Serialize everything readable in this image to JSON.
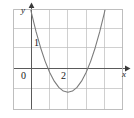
{
  "figure": {
    "name": "parabola-graph",
    "background_color": "#ffffff",
    "grid_color": "#b9b9b9",
    "axis_color": "#555555",
    "curve_color": "#6e6e6e",
    "border_color": "#b9b9b9"
  },
  "chart_data": {
    "type": "line",
    "title": "",
    "xlabel": "x",
    "ylabel": "y",
    "grid": true,
    "legend": false,
    "xlim": [
      -1,
      5
    ],
    "ylim": [
      -2.5,
      3
    ],
    "xticks": [
      0,
      2
    ],
    "yticks": [
      1
    ],
    "xtick_labels": [
      "0",
      "2"
    ],
    "ytick_labels": [
      "1"
    ],
    "x_minor_step": 1,
    "y_minor_step": 1,
    "annotations": [],
    "series": [
      {
        "name": "parabola",
        "equation": "y = (x - 2)^2 - 1.2",
        "vertex": [
          2,
          -1.2
        ],
        "roots": [
          0.3,
          3.7
        ],
        "x": [
          -1.0,
          -0.75,
          -0.5,
          -0.25,
          0.0,
          0.25,
          0.5,
          0.75,
          1.0,
          1.25,
          1.5,
          1.75,
          2.0,
          2.25,
          2.5,
          2.75,
          3.0,
          3.25,
          3.5,
          3.75,
          4.0,
          4.25,
          4.5,
          4.75,
          5.0
        ],
        "y": [
          7.8,
          6.36,
          5.05,
          3.86,
          2.8,
          1.86,
          1.05,
          0.36,
          -0.2,
          -0.64,
          -0.95,
          -1.14,
          -1.2,
          -1.14,
          -0.95,
          -0.64,
          -0.2,
          0.36,
          1.05,
          1.86,
          2.8,
          3.86,
          5.05,
          6.36,
          7.8
        ]
      }
    ]
  },
  "labels": {
    "y_axis": "y",
    "x_axis": "x",
    "origin": "0",
    "y_one": "1",
    "x_two": "2"
  }
}
